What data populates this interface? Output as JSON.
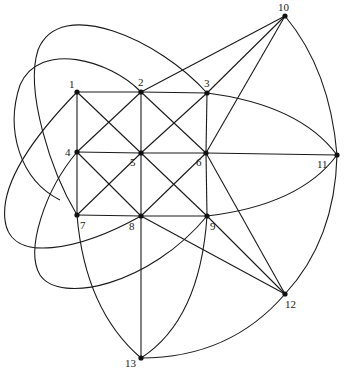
{
  "diagram": {
    "type": "graph",
    "node_color": "#111111",
    "edge_color": "#1a1a1a",
    "nodes": [
      {
        "id": "1",
        "label": "1",
        "x": 77,
        "y": 92,
        "lx": 69,
        "ly": 88
      },
      {
        "id": "2",
        "label": "2",
        "x": 141,
        "y": 92,
        "lx": 138,
        "ly": 86
      },
      {
        "id": "3",
        "label": "3",
        "x": 207,
        "y": 93,
        "lx": 204,
        "ly": 87
      },
      {
        "id": "4",
        "label": "4",
        "x": 77,
        "y": 152,
        "lx": 65,
        "ly": 156
      },
      {
        "id": "5",
        "label": "5",
        "x": 141,
        "y": 153,
        "lx": 130,
        "ly": 166
      },
      {
        "id": "6",
        "label": "6",
        "x": 206,
        "y": 153,
        "lx": 196,
        "ly": 166
      },
      {
        "id": "7",
        "label": "7",
        "x": 77,
        "y": 215,
        "lx": 80,
        "ly": 229
      },
      {
        "id": "8",
        "label": "8",
        "x": 141,
        "y": 216,
        "lx": 129,
        "ly": 230
      },
      {
        "id": "9",
        "label": "9",
        "x": 207,
        "y": 216,
        "lx": 210,
        "ly": 230
      },
      {
        "id": "10",
        "label": "10",
        "x": 285,
        "y": 16,
        "lx": 278,
        "ly": 11
      },
      {
        "id": "11",
        "label": "11",
        "x": 337,
        "y": 155,
        "lx": 317,
        "ly": 168
      },
      {
        "id": "12",
        "label": "12",
        "x": 285,
        "y": 294,
        "lx": 285,
        "ly": 308
      },
      {
        "id": "13",
        "label": "13",
        "x": 141,
        "y": 358,
        "lx": 125,
        "ly": 367
      }
    ],
    "edges": [
      {
        "from": "1",
        "to": "2",
        "path": "M77,92 L141,92"
      },
      {
        "from": "2",
        "to": "3",
        "path": "M141,92 L207,93"
      },
      {
        "from": "4",
        "to": "5",
        "path": "M77,152 L141,153"
      },
      {
        "from": "5",
        "to": "6",
        "path": "M141,153 L206,153"
      },
      {
        "from": "7",
        "to": "8",
        "path": "M77,215 L141,216"
      },
      {
        "from": "8",
        "to": "9",
        "path": "M141,216 L207,216"
      },
      {
        "from": "1",
        "to": "4",
        "path": "M77,92 L77,152"
      },
      {
        "from": "4",
        "to": "7",
        "path": "M77,152 L77,215"
      },
      {
        "from": "2",
        "to": "5",
        "path": "M141,92 L141,153"
      },
      {
        "from": "5",
        "to": "8",
        "path": "M141,153 L141,216"
      },
      {
        "from": "3",
        "to": "6",
        "path": "M207,93 L206,153"
      },
      {
        "from": "6",
        "to": "9",
        "path": "M206,153 L207,216"
      },
      {
        "from": "1",
        "to": "5",
        "path": "M77,92 L141,153"
      },
      {
        "from": "5",
        "to": "9",
        "path": "M141,153 L207,216"
      },
      {
        "from": "3",
        "to": "5",
        "path": "M207,93 L141,153"
      },
      {
        "from": "5",
        "to": "7",
        "path": "M141,153 L77,215"
      },
      {
        "from": "2",
        "to": "4",
        "path": "M141,92 L77,152"
      },
      {
        "from": "2",
        "to": "6",
        "path": "M141,92 L206,153"
      },
      {
        "from": "4",
        "to": "8",
        "path": "M77,152 L141,216"
      },
      {
        "from": "6",
        "to": "8",
        "path": "M206,153 L141,216"
      },
      {
        "from": "2",
        "to": "10",
        "path": "M141,92 L285,16"
      },
      {
        "from": "3",
        "to": "10",
        "path": "M207,93 L285,16"
      },
      {
        "from": "6",
        "to": "10",
        "path": "M206,153 L285,16"
      },
      {
        "from": "6",
        "to": "11",
        "path": "M206,153 L337,155"
      },
      {
        "from": "6",
        "to": "12",
        "path": "M206,153 L285,294"
      },
      {
        "from": "9",
        "to": "12",
        "path": "M207,216 L285,294"
      },
      {
        "from": "8",
        "to": "12",
        "path": "M141,216 L285,294"
      },
      {
        "from": "8",
        "to": "13",
        "path": "M141,216 L141,358"
      },
      {
        "from": "10",
        "to": "11",
        "path": "M285,16 Q330,70 337,155"
      },
      {
        "from": "11",
        "to": "12",
        "path": "M337,155 Q335,240 285,294"
      },
      {
        "from": "3",
        "to": "11",
        "path": "M207,93 Q300,105 337,155"
      },
      {
        "from": "9",
        "to": "11",
        "path": "M207,216 Q300,205 337,155"
      },
      {
        "from": "12",
        "to": "13",
        "path": "M285,294 Q230,358 141,358"
      },
      {
        "from": "7",
        "to": "13",
        "path": "M77,215 Q85,310 141,358"
      },
      {
        "from": "9",
        "to": "13",
        "path": "M207,216 Q200,320 141,358"
      },
      {
        "from": "3",
        "to": "7",
        "path": "M207,93 C160,40 60,-5 38,50 C25,90 50,170 77,215"
      },
      {
        "from": "2",
        "to": "7",
        "path": "M141,92 C110,60 40,40 20,85 C5,130 20,180 60,200"
      },
      {
        "from": "1",
        "to": "8",
        "path": "M77,92 C40,130 0,180 5,220 C10,265 80,250 141,216"
      },
      {
        "from": "4",
        "to": "9",
        "path": "M77,152 C45,190 25,250 40,275 C60,305 150,285 207,216"
      }
    ]
  }
}
